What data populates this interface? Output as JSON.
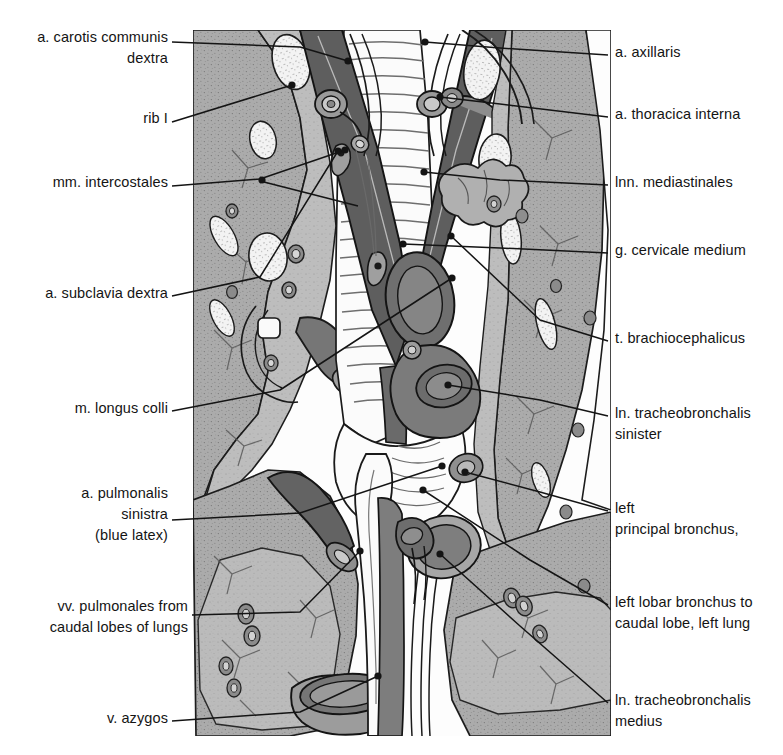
{
  "figure": {
    "kind": "anatomical-illustration",
    "region": "thorax cranial mediastinum, ventral view",
    "background_color": "#ffffff",
    "palette": {
      "outline": "#1a1a1a",
      "muscle_mid_gray": "#a8a8a8",
      "muscle_light_gray": "#c2c2c2",
      "vessel_dark_gray": "#6e6e6e",
      "vessel_darker_gray": "#5a5a5a",
      "trachea_white": "#fbfbfb",
      "node_white": "#f4f4f4",
      "leader_line": "#141414"
    }
  },
  "labels_left": [
    {
      "id": "a-carotis-communis-dextra",
      "lines": [
        "a. carotis communis",
        "dextra"
      ],
      "align": "right",
      "x": 8,
      "y": 27,
      "width": 160,
      "leader": [
        [
          172,
          42
        ],
        [
          300,
          47
        ],
        [
          348,
          61
        ]
      ],
      "dot": [
        348,
        61
      ]
    },
    {
      "id": "rib-i",
      "lines": [
        "rib I"
      ],
      "align": "right",
      "x": 8,
      "y": 108,
      "width": 160,
      "leader": [
        [
          172,
          122
        ],
        [
          292,
          85
        ]
      ],
      "dot": [
        292,
        85
      ]
    },
    {
      "id": "mm-intercostales",
      "lines": [
        "mm. intercostales"
      ],
      "align": "right",
      "x": 8,
      "y": 172,
      "width": 160,
      "leader": [
        [
          172,
          186
        ],
        [
          260,
          179
        ],
        [
          345,
          150
        ]
      ],
      "leader2": [
        [
          260,
          179
        ],
        [
          260,
          181
        ],
        [
          358,
          206
        ]
      ],
      "dot": [
        345,
        150
      ],
      "dot2": [
        262,
        180
      ]
    },
    {
      "id": "a-subclavia-dextra",
      "lines": [
        "a. subclavia dextra"
      ],
      "align": "right",
      "x": 8,
      "y": 283,
      "width": 160,
      "leader": [
        [
          172,
          296
        ],
        [
          260,
          277
        ],
        [
          338,
          151
        ]
      ],
      "dot": [
        338,
        151
      ]
    },
    {
      "id": "m-longus-colli",
      "lines": [
        "m. longus colli"
      ],
      "align": "right",
      "x": 8,
      "y": 398,
      "width": 160,
      "leader": [
        [
          172,
          411
        ],
        [
          280,
          390
        ],
        [
          452,
          278
        ]
      ],
      "dot": [
        452,
        278
      ]
    },
    {
      "id": "a-pulmonalis-sinistra",
      "lines": [
        "a. pulmonalis",
        "sinistra",
        "(blue latex)"
      ],
      "align": "right",
      "x": 8,
      "y": 483,
      "width": 160,
      "leader": [
        [
          172,
          520
        ],
        [
          300,
          513
        ],
        [
          442,
          466
        ]
      ],
      "dot": [
        442,
        466
      ]
    },
    {
      "id": "vv-pulmonales-caudal-lobes",
      "lines": [
        "vv. pulmonales from",
        "caudal lobes of lungs"
      ],
      "align": "right",
      "x": 8,
      "y": 596,
      "width": 180,
      "leader": [
        [
          192,
          615
        ],
        [
          300,
          612
        ],
        [
          360,
          551
        ]
      ],
      "dot": [
        360,
        551
      ]
    },
    {
      "id": "v-azygos",
      "lines": [
        "v. azygos"
      ],
      "align": "right",
      "x": 8,
      "y": 708,
      "width": 160,
      "leader": [
        [
          172,
          721
        ],
        [
          300,
          712
        ],
        [
          378,
          676
        ]
      ],
      "dot": [
        378,
        676
      ]
    }
  ],
  "labels_right": [
    {
      "id": "a-axillaris",
      "lines": [
        "a. axillaris"
      ],
      "align": "left",
      "x": 615,
      "y": 42,
      "width": 168,
      "leader": [
        [
          608,
          55
        ],
        [
          500,
          48
        ],
        [
          425,
          42
        ]
      ],
      "dot": [
        425,
        42
      ]
    },
    {
      "id": "a-thoracica-interna",
      "lines": [
        "a. thoracica interna"
      ],
      "align": "left",
      "x": 615,
      "y": 104,
      "width": 168,
      "leader": [
        [
          608,
          117
        ],
        [
          500,
          104
        ],
        [
          440,
          97
        ]
      ],
      "dot": [
        440,
        97
      ]
    },
    {
      "id": "lnn-mediastinales",
      "lines": [
        "lnn. mediastinales"
      ],
      "align": "left",
      "x": 615,
      "y": 172,
      "width": 168,
      "leader": [
        [
          608,
          185
        ],
        [
          500,
          180
        ],
        [
          424,
          172
        ]
      ],
      "dot": [
        424,
        172
      ]
    },
    {
      "id": "g-cervicale-medium",
      "lines": [
        "g. cervicale medium"
      ],
      "align": "left",
      "x": 615,
      "y": 240,
      "width": 168,
      "leader": [
        [
          608,
          253
        ],
        [
          500,
          248
        ],
        [
          403,
          244
        ]
      ],
      "dot": [
        403,
        244
      ]
    },
    {
      "id": "t-brachiocephalicus",
      "lines": [
        "t. brachiocephalicus"
      ],
      "align": "left",
      "x": 615,
      "y": 328,
      "width": 168,
      "leader": [
        [
          608,
          341
        ],
        [
          540,
          320
        ],
        [
          451,
          236
        ]
      ],
      "dot": [
        451,
        236
      ]
    },
    {
      "id": "ln-tracheobronchalis-sinister",
      "lines": [
        "ln. tracheobronchalis",
        "sinister"
      ],
      "align": "left",
      "x": 615,
      "y": 403,
      "width": 168,
      "leader": [
        [
          608,
          416
        ],
        [
          540,
          400
        ],
        [
          448,
          385
        ]
      ],
      "dot": [
        448,
        385
      ]
    },
    {
      "id": "left-principal-bronchus",
      "lines": [
        "left",
        "principal bronchus,"
      ],
      "align": "left",
      "x": 615,
      "y": 498,
      "width": 168,
      "leader": [
        [
          608,
          511
        ],
        [
          540,
          492
        ],
        [
          465,
          472
        ]
      ],
      "dot": [
        465,
        472
      ]
    },
    {
      "id": "left-lobar-bronchus-caudal",
      "lines": [
        "left lobar bronchus to",
        "caudal lobe, left lung"
      ],
      "align": "left",
      "x": 615,
      "y": 592,
      "width": 180,
      "leader": [
        [
          608,
          605
        ],
        [
          530,
          560
        ],
        [
          423,
          490
        ]
      ],
      "dot": [
        423,
        490
      ]
    },
    {
      "id": "ln-tracheobronchalis-medius",
      "lines": [
        "ln. tracheobronchalis",
        "medius"
      ],
      "align": "left",
      "x": 615,
      "y": 690,
      "width": 180,
      "leader": [
        [
          608,
          703
        ],
        [
          520,
          626
        ],
        [
          440,
          554
        ]
      ],
      "dot": [
        440,
        554
      ]
    }
  ],
  "structures": {
    "trachea": "cartilage rings, midline, white",
    "veins_v_shape": "vv. jugulares / brachiocephalic veins forming inverted V, dark gray",
    "lymph_nodes": "oval white speckled nodes in muscle fields",
    "lung_fields": "stippled gray masses lateral and caudal",
    "muscle_fields": "mid-gray stippled longus colli / intercostal planes"
  }
}
